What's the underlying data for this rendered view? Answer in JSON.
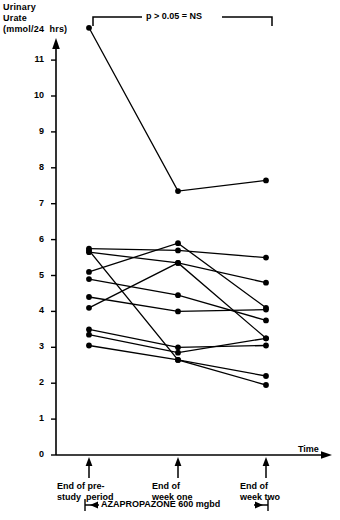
{
  "chart_data": {
    "type": "line",
    "title": "",
    "ylabel": "Urinary\nUrate\n(mmol/24  hrs)",
    "xlabel": "Time",
    "ylim": [
      0,
      11.5
    ],
    "grid": false,
    "legend": null,
    "y_ticks": [
      0,
      1,
      2,
      3,
      4,
      5,
      6,
      7,
      8,
      9,
      10,
      11
    ],
    "y_tick_labels": [
      "0",
      "1",
      "2",
      "3",
      "4",
      "5",
      "6",
      "7",
      "8",
      "9",
      "10",
      "11"
    ],
    "categories": [
      "End of pre-\nstudy  period",
      "End of\nweek one",
      "End of\nweek two"
    ],
    "x_positions": [
      89,
      178,
      266
    ],
    "annotation": "p > 0.05 = NS",
    "treatment_bar": "AZAPROPAZONE  600  mgbd",
    "marker": "filled-circle",
    "series": [
      {
        "name": "patient-1",
        "values": [
          11.9,
          7.35,
          7.65
        ]
      },
      {
        "name": "patient-2",
        "values": [
          5.75,
          5.7,
          5.5
        ]
      },
      {
        "name": "patient-3",
        "values": [
          5.65,
          5.35,
          4.8
        ]
      },
      {
        "name": "patient-4",
        "values": [
          5.1,
          5.9,
          4.1
        ]
      },
      {
        "name": "patient-5",
        "values": [
          4.9,
          4.45,
          3.75
        ]
      },
      {
        "name": "patient-6",
        "values": [
          4.4,
          4.0,
          4.05
        ]
      },
      {
        "name": "patient-7",
        "values": [
          4.1,
          5.35,
          3.25
        ]
      },
      {
        "name": "patient-8",
        "values": [
          3.5,
          3.0,
          3.05
        ]
      },
      {
        "name": "patient-9",
        "values": [
          3.35,
          2.85,
          3.25
        ]
      },
      {
        "name": "patient-10",
        "values": [
          3.05,
          2.65,
          2.2
        ]
      },
      {
        "name": "patient-11",
        "values": [
          5.7,
          2.65,
          1.95
        ]
      }
    ]
  },
  "axes": {
    "y_axis_name": "urinary-urate-axis",
    "x_axis_name": "time-axis",
    "time_label": "Time"
  }
}
